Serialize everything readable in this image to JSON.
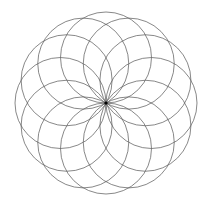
{
  "figure": {
    "type": "rosette",
    "circle_count": 12,
    "center": [
      106,
      103
    ],
    "ring_radius": 45.5,
    "circle_radius": 45.5,
    "stroke_color": "#555555",
    "center_dot_color": "#000000",
    "background": "#ffffff"
  }
}
